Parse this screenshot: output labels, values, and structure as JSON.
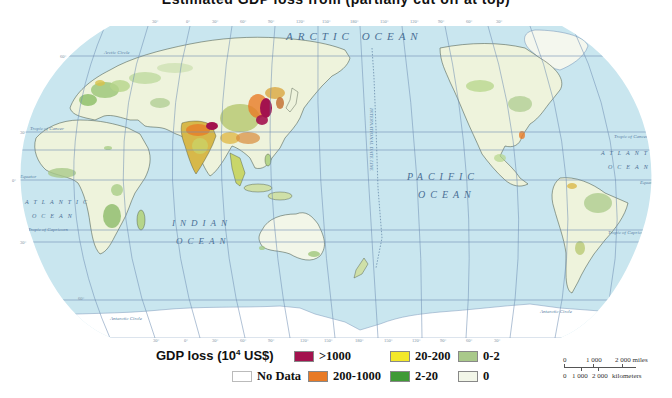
{
  "title": {
    "text": "Estimated GDP loss from (partially cut off at top)",
    "visible_partial": true
  },
  "map": {
    "projection": "Robinson-like, Pacific-centered",
    "ocean_color": "#c9e6ef",
    "land_base_color": "#f4f7e8",
    "graticule_color": "#6f8fb4",
    "ocean_labels": {
      "arctic": "ARCTIC OCEAN",
      "pacific_1": "PACIFIC",
      "pacific_2": "OCEAN",
      "indian_1": "INDIAN",
      "indian_2": "OCEAN",
      "atlantic_w_1": "ATLANTIC",
      "atlantic_w_2": "OCEAN",
      "atlantic_e_1": "ATLANTIC",
      "atlantic_e_2": "OCEAN"
    },
    "line_labels": {
      "arctic_circle": "Arctic Circle",
      "tropic_cancer": "Tropic of Cancer",
      "equator": "Equator",
      "tropic_capricorn": "Tropic of Capricorn",
      "antarctic_circle": "Antarctic Circle",
      "date_line": "INTERNATIONAL DATE LINE"
    },
    "latitude_labels": [
      "60°",
      "30°",
      "0°",
      "30°",
      "60°"
    ],
    "longitude_labels_top": [
      "30°",
      "0°",
      "30°",
      "60°",
      "90°",
      "120°",
      "150°",
      "180°",
      "150°",
      "120°",
      "90°",
      "60°",
      "30°"
    ],
    "longitude_labels_bottom": [
      "30°",
      "0°",
      "30°",
      "60°",
      "90°",
      "120°",
      "150°",
      "180°",
      "150°",
      "120°",
      "90°",
      "60°",
      "30°"
    ]
  },
  "legend": {
    "title_prefix": "GDP loss (10",
    "title_sup": "4",
    "title_suffix": " US$)",
    "items": [
      {
        "label": ">1000",
        "color": "#a3124e"
      },
      {
        "label": "20-200",
        "color": "#f3e82a"
      },
      {
        "label": "0-2",
        "color": "#a9c98a"
      },
      {
        "label": "No Data",
        "color": "#ffffff"
      },
      {
        "label": "200-1000",
        "color": "#e87a25"
      },
      {
        "label": "2-20",
        "color": "#3f9a35"
      },
      {
        "label": "0",
        "color": "#f2f6e8"
      }
    ]
  },
  "scale_bar": {
    "miles_labels": [
      "0",
      "1 000",
      "2 000 miles"
    ],
    "km_labels": [
      "0",
      "1 000",
      "2 000",
      "kilometers"
    ]
  }
}
